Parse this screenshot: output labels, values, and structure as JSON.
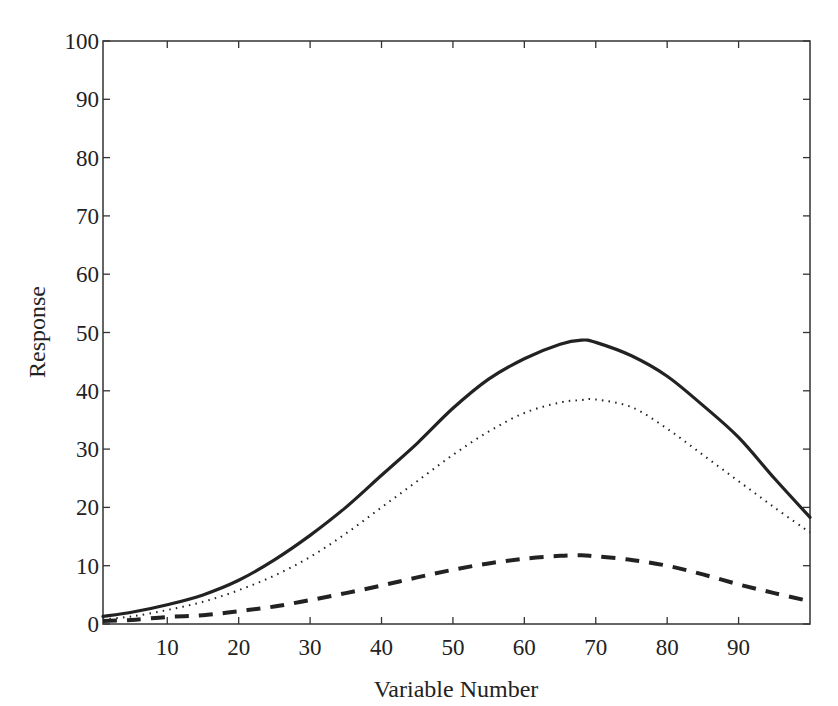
{
  "chart_data": {
    "type": "line",
    "title": "",
    "xlabel": "Variable Number",
    "ylabel": "Response",
    "xlim": [
      1,
      100
    ],
    "ylim": [
      0,
      100
    ],
    "grid": false,
    "legend": null,
    "x_ticks": [
      10,
      20,
      30,
      40,
      50,
      60,
      70,
      80,
      90
    ],
    "y_ticks": [
      0,
      10,
      20,
      30,
      40,
      50,
      60,
      70,
      80,
      90,
      100
    ],
    "x": [
      1,
      5,
      10,
      15,
      20,
      25,
      30,
      35,
      40,
      45,
      50,
      55,
      60,
      65,
      68,
      70,
      75,
      80,
      85,
      90,
      95,
      100
    ],
    "series": [
      {
        "name": "solid",
        "style": "solid",
        "color": "#222222",
        "values": [
          1.3,
          2.0,
          3.3,
          5.0,
          7.5,
          11.0,
          15.2,
          20.0,
          25.5,
          31.0,
          37.0,
          42.0,
          45.5,
          48.0,
          48.7,
          48.3,
          46.0,
          42.5,
          37.5,
          32.0,
          25.0,
          18.3
        ]
      },
      {
        "name": "dotted",
        "style": "dotted",
        "color": "#222222",
        "values": [
          0.8,
          1.3,
          2.4,
          3.8,
          5.8,
          8.3,
          11.5,
          15.5,
          20.0,
          24.5,
          29.0,
          33.0,
          36.2,
          38.0,
          38.4,
          38.5,
          37.2,
          33.5,
          29.0,
          24.5,
          20.0,
          15.7
        ]
      },
      {
        "name": "dashed",
        "style": "dashed",
        "color": "#222222",
        "values": [
          0.5,
          0.7,
          1.2,
          1.5,
          2.2,
          3.0,
          4.1,
          5.3,
          6.6,
          8.0,
          9.3,
          10.4,
          11.2,
          11.7,
          11.8,
          11.6,
          11.0,
          10.0,
          8.5,
          6.8,
          5.3,
          3.9
        ]
      }
    ]
  },
  "axes": {
    "xlabel": "Variable Number",
    "ylabel": "Response"
  }
}
